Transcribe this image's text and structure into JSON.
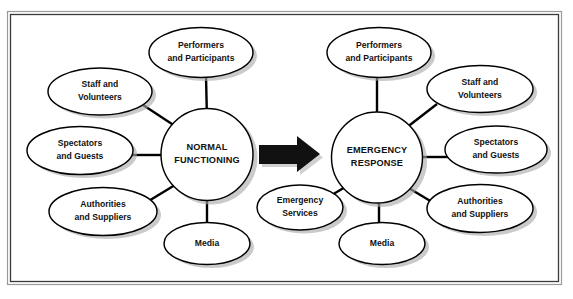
{
  "figure": {
    "frame_color": "#9a9a9a",
    "node_fill": "#ffffff",
    "node_stroke": "#000000",
    "shadow_color": "#a9a9a9",
    "arrow_color": "#111111"
  },
  "left_cluster": {
    "hub": {
      "line1": "NORMAL",
      "line2": "FUNCTIONING"
    },
    "nodes": [
      {
        "id": "performers",
        "line1": "Performers",
        "line2": "and Participants"
      },
      {
        "id": "staff",
        "line1": "Staff and",
        "line2": "Volunteers"
      },
      {
        "id": "spectators",
        "line1": "Spectators",
        "line2": "and Guests"
      },
      {
        "id": "authorities",
        "line1": "Authorities",
        "line2": "and Suppliers"
      },
      {
        "id": "media",
        "line1": "Media",
        "line2": ""
      }
    ]
  },
  "transition": {
    "arrow_name": "right-arrow",
    "arrow_label": ""
  },
  "right_cluster": {
    "hub": {
      "line1": "EMERGENCY",
      "line2": "RESPONSE"
    },
    "nodes": [
      {
        "id": "performers",
        "line1": "Performers",
        "line2": "and Participants"
      },
      {
        "id": "staff",
        "line1": "Staff and",
        "line2": "Volunteers"
      },
      {
        "id": "spectators",
        "line1": "Spectators",
        "line2": "and Guests"
      },
      {
        "id": "authorities",
        "line1": "Authorities",
        "line2": "and Suppliers"
      },
      {
        "id": "emergency-services",
        "line1": "Emergency",
        "line2": "Services"
      },
      {
        "id": "media",
        "line1": "Media",
        "line2": ""
      }
    ]
  }
}
